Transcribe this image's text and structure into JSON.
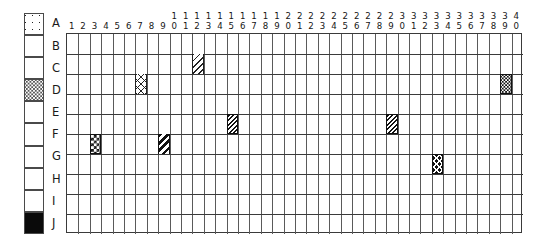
{
  "figure": {
    "kind": "grid-matrix-chart",
    "rows_count": 10,
    "cols_count": 40
  },
  "legend": {
    "name": "row-legend",
    "items": [
      {
        "label": "A",
        "pattern": "dots-sparse"
      },
      {
        "label": "B",
        "pattern": "white"
      },
      {
        "label": "C",
        "pattern": "white"
      },
      {
        "label": "D",
        "pattern": "dots-dense"
      },
      {
        "label": "E",
        "pattern": "white"
      },
      {
        "label": "F",
        "pattern": "white"
      },
      {
        "label": "G",
        "pattern": "white"
      },
      {
        "label": "H",
        "pattern": "white"
      },
      {
        "label": "I",
        "pattern": "white"
      },
      {
        "label": "J",
        "pattern": "solid-black"
      }
    ]
  },
  "columns": {
    "name": "column-header",
    "labels": [
      "1",
      "2",
      "3",
      "4",
      "5",
      "6",
      "7",
      "8",
      "9",
      "10",
      "11",
      "12",
      "13",
      "14",
      "15",
      "16",
      "17",
      "18",
      "19",
      "20",
      "21",
      "22",
      "23",
      "24",
      "25",
      "26",
      "27",
      "28",
      "29",
      "30",
      "31",
      "32",
      "33",
      "34",
      "35",
      "36",
      "37",
      "38",
      "39",
      "40"
    ]
  },
  "grid": {
    "name": "data-grid",
    "row_labels": [
      "A",
      "B",
      "C",
      "D",
      "E",
      "F",
      "G",
      "H",
      "I",
      "J"
    ],
    "filled_cells": [
      {
        "row": "B",
        "col": 12,
        "pattern": "diag-light",
        "description": "light diagonal hatch"
      },
      {
        "row": "C",
        "col": 7,
        "pattern": "xhatch-light",
        "description": "light cross hatch"
      },
      {
        "row": "C",
        "col": 39,
        "pattern": "stipple-dark",
        "description": "dark stippled"
      },
      {
        "row": "E",
        "col": 15,
        "pattern": "diag-dense",
        "description": "dense diagonal hatch"
      },
      {
        "row": "E",
        "col": 29,
        "pattern": "diag-dense",
        "description": "dense diagonal hatch"
      },
      {
        "row": "F",
        "col": 3,
        "pattern": "checker",
        "description": "checkerboard"
      },
      {
        "row": "F",
        "col": 9,
        "pattern": "diag-bold",
        "description": "bold diagonal stripes"
      },
      {
        "row": "G",
        "col": 33,
        "pattern": "xhatch-dark",
        "description": "dark cross hatch"
      }
    ]
  },
  "colors": {
    "ink": "#1a1a1a",
    "grid_line": "#5a5a5a",
    "grid_border": "#3a3a3a",
    "background": "#ffffff"
  }
}
